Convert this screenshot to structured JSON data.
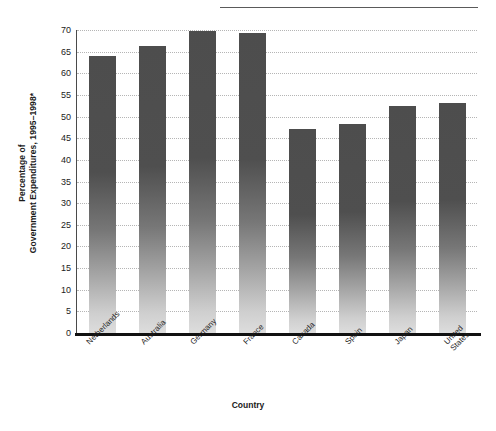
{
  "chart_data": {
    "type": "bar",
    "title": "",
    "subtitle": "",
    "xlabel": "Country",
    "ylabel_line1": "Percentage of",
    "ylabel_line2": "Government Expenditures, 1995–1998*",
    "categories": [
      "Netherlands",
      "Australia",
      "Germany",
      "France",
      "Canada",
      "Spain",
      "Japan",
      "United States"
    ],
    "category_lines": [
      [
        "Netherlands"
      ],
      [
        "Australia"
      ],
      [
        "Germany"
      ],
      [
        "France"
      ],
      [
        "Canada"
      ],
      [
        "Spain"
      ],
      [
        "Japan"
      ],
      [
        "United",
        "States"
      ]
    ],
    "values": [
      64.0,
      66.3,
      69.8,
      69.2,
      47.2,
      48.3,
      52.5,
      53.2
    ],
    "ylim": [
      0,
      70
    ],
    "ytick_step": 5,
    "yticks": [
      0,
      5,
      10,
      15,
      20,
      25,
      30,
      35,
      40,
      45,
      50,
      55,
      60,
      65,
      70
    ],
    "ytick_labels": [
      "0",
      "5",
      "10",
      "15",
      "20",
      "25",
      "30",
      "35",
      "40",
      "45",
      "50",
      "55",
      "60",
      "65",
      "70"
    ],
    "grid": true,
    "grid_style": "dotted horizontal",
    "legend": "none",
    "bar_fill": "vertical gradient dark-gray to light-gray",
    "bar_color_top": "#4d4d4d",
    "bar_color_bottom": "#dddddd",
    "axis_color": "#111111",
    "grid_color": "#b5b5b5",
    "annotations": [
      "* footnote marker on y-axis title"
    ]
  },
  "figure": {
    "top_rule": true,
    "background": "#ffffff"
  }
}
